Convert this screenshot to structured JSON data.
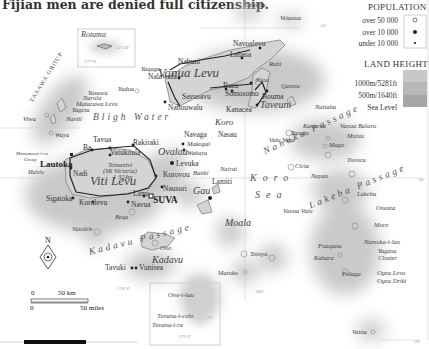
{
  "caption": "Fijian men are denied full citizenship.",
  "legend": {
    "population_title": "POPULATION",
    "population": [
      {
        "label": "over 50 000",
        "symbol": "open-circle"
      },
      {
        "label": "over 10 000",
        "symbol": "large-dot"
      },
      {
        "label": "under 10 000",
        "symbol": "small-dot"
      }
    ],
    "height_title": "LAND HEIGHT",
    "heights": [
      {
        "label": "1000m/5281ft"
      },
      {
        "label": "500m/1640ft"
      },
      {
        "label": "Sea Level"
      }
    ],
    "height_colors": [
      "#c8c8c8",
      "#b4b4b4",
      "#a0a0a0"
    ]
  },
  "inset": {
    "rotuma_label": "Rotuma",
    "rotuma_lat": "12°30'",
    "rotuma_lon": "177°E",
    "south_islands": [
      "Ono-i-lau",
      "Tuvana-i-colo",
      "Tuvana-i-ra"
    ],
    "south_lat": "21°",
    "south_lon": "179°E"
  },
  "regions": {
    "vanua_levu": "Vanua Levu",
    "viti_levu": "Viti Levu",
    "taveuni": "Taveuni",
    "kadavu": "Kadavu",
    "ovalau": "Ovalau",
    "koro": "Koro",
    "gau": "Gau",
    "moala": "Moala",
    "yasawa_group": "YASAWA GROUP"
  },
  "seas": {
    "bligh_water": "Bligh Water",
    "koro_sea_1": "Koro",
    "koro_sea_2": "Sea",
    "nanuku_passage": "Nanuku Passage",
    "kadavu_passage": "Kadavu Passage",
    "lakeba_passage": "Lakeba Passage"
  },
  "towns": {
    "suva": "SUVA",
    "lautoka": "Lautoka",
    "nadi": "Nadi",
    "ba": "Ba",
    "tavua": "Tavua",
    "rakiraki": "Rakiraki",
    "vatukoula": "Vatukoula",
    "tomanivi": "Tomanivi",
    "tomanivi_sub": "(Mt Victoria)",
    "tomanivi_height": "1 324m",
    "korovou": "Korovou",
    "nausori": "Nausori",
    "lami": "Lami",
    "navua": "Navua",
    "korolevu": "Korolevu",
    "sigatoka": "Sigatoka",
    "levuka": "Levuka",
    "navaga": "Navaga",
    "nasau": "Nasau",
    "lamiti": "Lamiti",
    "naboualevu": "Navoalevu",
    "labasa": "Labasa",
    "nabuni": "Nabuni",
    "nabouwalu": "Nabouwalu",
    "savusavu": "Savusavu",
    "nalawalu": "Nalawalu",
    "buca": "Buca",
    "somosomo": "Somosomo",
    "bouma": "Bouma",
    "kanacea": "Kanacea",
    "tavuki": "Tavuki",
    "vunisea": "Vunisea"
  },
  "islands": {
    "yasawa": "Yasawa",
    "narula": "Narula",
    "matacawa_levu": "Matacawa Levu",
    "yageta": "Yageta",
    "naviti": "Naviti",
    "viwa": "Viwa",
    "waya": "Waya",
    "mamanuca": "Mamanuca-i-ra",
    "mamanuca2": "Group",
    "malolo": "Malolo",
    "yadua": "Yadua",
    "yaqaga": "Yaqaga",
    "makogai": "Makogai",
    "wakaya": "Wakaya",
    "batiki": "Batiki",
    "nairai": "Nairai",
    "beqa": "Beqa",
    "vatulele": "Vatulele",
    "ono": "Ono",
    "cikobia": "Cikobia",
    "vetauua": "Vetauua",
    "rabi": "Rabi",
    "kioa": "Kioa",
    "qamea": "Qamea",
    "naitaba": "Naitaba",
    "kanacea_isl": "Kanacea",
    "vanua_balavu": "Vanua Balavu",
    "yacata": "Yacata",
    "vatu_vara": "Vatu Vara",
    "munia": "Munia",
    "mago": "Mago",
    "tuvuca": "Tuvuca",
    "cicia": "Cicia",
    "nayau": "Nayau",
    "lakeba": "Lakeba",
    "oneata": "Oneata",
    "moce": "Moce",
    "vanua_vatu": "Vanua Vatu",
    "namuka": "Namuka-i-lau",
    "yagasa": "Yagasa",
    "yagasa2": "Cluster",
    "fuaqana": "Fuaqana",
    "kabara": "Kabara",
    "fulaga": "Fulaga",
    "ogea_levu": "Ogea Levu",
    "ogea_driki": "Ogea Driki",
    "totoya": "Totoya",
    "matuku": "Matuku",
    "vatoa": "Vatoa"
  },
  "graticule": {
    "lon_180": "180°",
    "lon_178": "178°E",
    "lat_16": "16°",
    "lat_18": "18°",
    "lat_20": "20°",
    "lat_178w": "178°"
  },
  "compass": {
    "north": "N"
  },
  "scale": {
    "km_zero": "0",
    "km_label": "50 km",
    "mi_zero": "0",
    "mi_label": "50 miles"
  }
}
